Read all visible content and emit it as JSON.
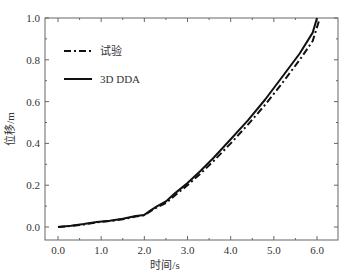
{
  "chart_data": {
    "type": "line",
    "title": "",
    "xlabel": "时间/s",
    "ylabel": "位移/m",
    "xlim": [
      -0.3,
      6.5
    ],
    "ylim": [
      -0.06,
      1.0
    ],
    "xticks": [
      "0.0",
      "1.0",
      "2.0",
      "3.0",
      "4.0",
      "5.0",
      "6.0"
    ],
    "xtick_values": [
      0,
      1,
      2,
      3,
      4,
      5,
      6
    ],
    "yticks": [
      "0.0",
      "0.2",
      "0.4",
      "0.6",
      "0.8",
      "1.0"
    ],
    "ytick_values": [
      0,
      0.2,
      0.4,
      0.6,
      0.8,
      1.0
    ],
    "grid": false,
    "legend_position": "top-left",
    "series": [
      {
        "name": "试验",
        "style": "dash-dot",
        "color": "#111111",
        "x": [
          0.0,
          0.3,
          0.6,
          0.9,
          1.2,
          1.5,
          1.8,
          2.0,
          2.1,
          2.3,
          2.5,
          2.7,
          3.0,
          3.3,
          3.6,
          4.0,
          4.4,
          4.8,
          5.2,
          5.6,
          5.9,
          6.05
        ],
        "y": [
          0.0,
          0.005,
          0.012,
          0.022,
          0.028,
          0.037,
          0.05,
          0.056,
          0.07,
          0.095,
          0.115,
          0.15,
          0.2,
          0.255,
          0.315,
          0.4,
          0.49,
          0.585,
          0.69,
          0.8,
          0.89,
          0.99
        ]
      },
      {
        "name": "3D DDA",
        "style": "solid",
        "color": "#111111",
        "x": [
          0.0,
          0.3,
          0.6,
          0.9,
          1.2,
          1.5,
          1.8,
          2.0,
          2.1,
          2.3,
          2.5,
          2.7,
          3.0,
          3.3,
          3.6,
          4.0,
          4.4,
          4.8,
          5.2,
          5.6,
          5.9,
          6.0
        ],
        "y": [
          0.0,
          0.006,
          0.014,
          0.024,
          0.03,
          0.039,
          0.052,
          0.058,
          0.073,
          0.1,
          0.122,
          0.16,
          0.21,
          0.268,
          0.33,
          0.42,
          0.51,
          0.61,
          0.72,
          0.83,
          0.93,
          1.0
        ]
      }
    ]
  }
}
